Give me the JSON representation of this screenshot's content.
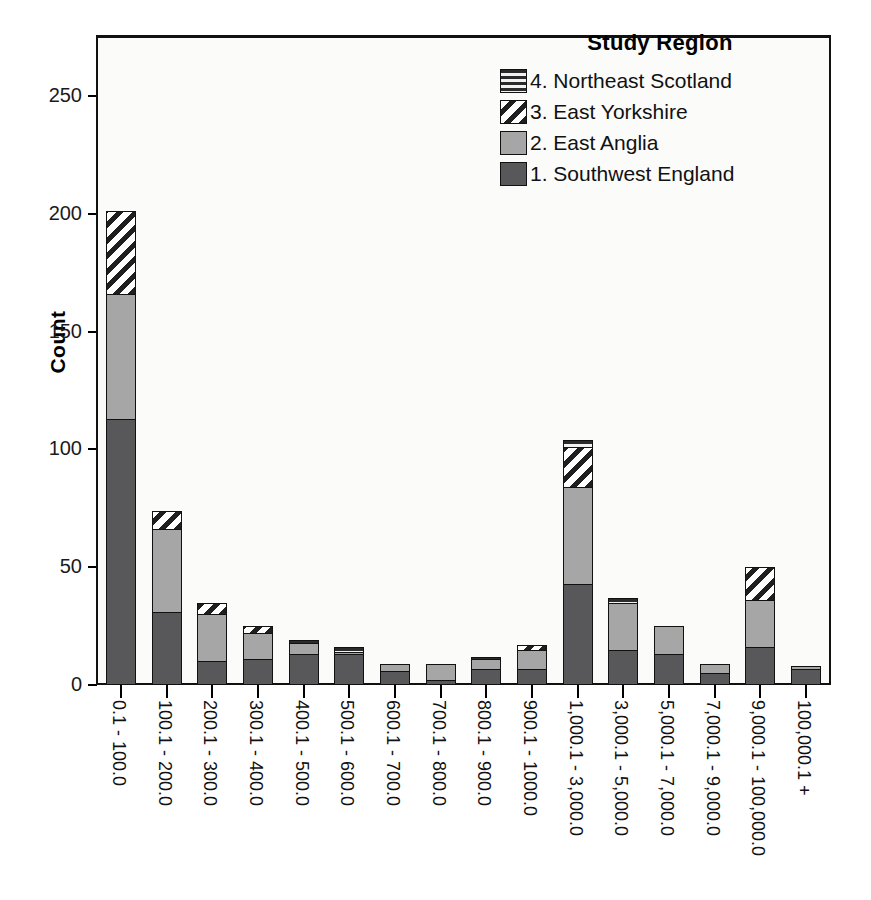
{
  "chart_data": {
    "type": "bar",
    "subtype": "stacked-bar",
    "title": "",
    "xlabel": "",
    "ylabel": "Count",
    "ylim": [
      0,
      275
    ],
    "yticks": [
      0,
      50,
      100,
      150,
      200,
      250
    ],
    "ytick_labels": [
      "0",
      "50",
      "100",
      "150",
      "200",
      "250"
    ],
    "grid": false,
    "legend_title": "Study Region",
    "legend_position": "top-right-inside",
    "legend_order_displayed": [
      "4. Northeast Scotland",
      "3. East Yorkshire",
      "2. East Anglia",
      "1. Southwest England"
    ],
    "categories": [
      "0.1 - 100.0",
      "100.1 - 200.0",
      "200.1 - 300.0",
      "300.1 - 400.0",
      "400.1 - 500.0",
      "500.1 - 600.0",
      "600.1 - 700.0",
      "700.1 - 800.0",
      "800.1 - 900.0",
      "900.1 - 1000.0",
      "1,000.1 - 3,000.0",
      "3,000.1 - 5,000.0",
      "5,000.1 - 7,000.0",
      "7,000.1 - 9,000.0",
      "9,000.1 - 100,000.0",
      "100,000.1 +"
    ],
    "series": [
      {
        "name": "1. Southwest England",
        "key": "r1",
        "color": "#58585a",
        "pattern": "solid-dark-gray",
        "values": [
          113,
          31,
          10,
          11,
          13,
          13,
          6,
          2,
          7,
          7,
          43,
          15,
          13,
          5,
          16,
          7
        ]
      },
      {
        "name": "2. East Anglia",
        "key": "r2",
        "color": "#a6a6a6",
        "pattern": "solid-light-gray",
        "values": [
          53,
          35,
          20,
          11,
          5,
          1,
          3,
          7,
          4,
          8,
          41,
          20,
          12,
          4,
          20,
          1
        ]
      },
      {
        "name": "3. East Yorkshire",
        "key": "r3",
        "color": "#1f1f1f",
        "pattern": "diagonal-hatch",
        "values": [
          35,
          8,
          5,
          3,
          0,
          0,
          0,
          0,
          0,
          2,
          17,
          0,
          0,
          0,
          14,
          0
        ]
      },
      {
        "name": "4. Northeast Scotland",
        "key": "r4",
        "color": "#2b2b2b",
        "pattern": "horizontal-hatch",
        "values": [
          0,
          0,
          0,
          0,
          1,
          2,
          0,
          0,
          1,
          0,
          3,
          2,
          0,
          0,
          0,
          0
        ]
      }
    ],
    "totals": [
      201,
      74,
      35,
      25,
      19,
      16,
      9,
      9,
      12,
      17,
      104,
      37,
      25,
      9,
      50,
      8
    ]
  },
  "legend": {
    "title": "Study Region",
    "items": [
      {
        "label": "4. Northeast Scotland",
        "swatch": "horizontal-hatch-swatch"
      },
      {
        "label": "3. East Yorkshire",
        "swatch": "diagonal-hatch-swatch"
      },
      {
        "label": "2. East Anglia",
        "swatch": "light-gray-swatch"
      },
      {
        "label": "1. Southwest England",
        "swatch": "dark-gray-swatch"
      }
    ]
  },
  "axes": {
    "y_title": "Count"
  }
}
